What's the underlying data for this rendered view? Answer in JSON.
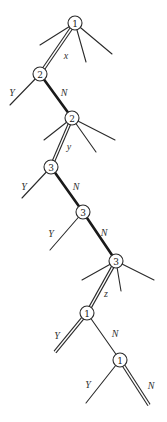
{
  "diagram": {
    "type": "search-tree",
    "nodes": [
      {
        "id": "n1",
        "label": "1",
        "x": 75,
        "y": 23
      },
      {
        "id": "n2",
        "label": "2",
        "x": 40,
        "y": 74
      },
      {
        "id": "n3",
        "label": "2",
        "x": 72,
        "y": 118
      },
      {
        "id": "n4",
        "label": "3",
        "x": 51,
        "y": 167
      },
      {
        "id": "n5",
        "label": "3",
        "x": 83,
        "y": 212
      },
      {
        "id": "n6",
        "label": "3",
        "x": 116,
        "y": 261
      },
      {
        "id": "n7",
        "label": "1",
        "x": 87,
        "y": 313
      },
      {
        "id": "n8",
        "label": "1",
        "x": 120,
        "y": 360
      }
    ],
    "edges": [
      {
        "from": [
          75,
          23
        ],
        "to": [
          40,
          45
        ],
        "style": "thin"
      },
      {
        "from": [
          75,
          23
        ],
        "to": [
          86,
          62
        ],
        "style": "thin"
      },
      {
        "from": [
          75,
          23
        ],
        "to": [
          112,
          54
        ],
        "style": "thin"
      },
      {
        "from": [
          75,
          23
        ],
        "to": [
          40,
          74
        ],
        "style": "double"
      },
      {
        "from": [
          40,
          74
        ],
        "to": [
          10,
          105
        ],
        "style": "thin"
      },
      {
        "from": [
          40,
          74
        ],
        "to": [
          72,
          118
        ],
        "style": "bold"
      },
      {
        "from": [
          72,
          118
        ],
        "to": [
          44,
          140
        ],
        "style": "thin"
      },
      {
        "from": [
          72,
          118
        ],
        "to": [
          96,
          152
        ],
        "style": "thin"
      },
      {
        "from": [
          72,
          118
        ],
        "to": [
          115,
          140
        ],
        "style": "thin"
      },
      {
        "from": [
          72,
          118
        ],
        "to": [
          51,
          167
        ],
        "style": "double"
      },
      {
        "from": [
          51,
          167
        ],
        "to": [
          22,
          198
        ],
        "style": "thin"
      },
      {
        "from": [
          51,
          167
        ],
        "to": [
          83,
          212
        ],
        "style": "bold"
      },
      {
        "from": [
          83,
          212
        ],
        "to": [
          50,
          250
        ],
        "style": "thin"
      },
      {
        "from": [
          83,
          212
        ],
        "to": [
          116,
          261
        ],
        "style": "bold"
      },
      {
        "from": [
          116,
          261
        ],
        "to": [
          82,
          280
        ],
        "style": "thin"
      },
      {
        "from": [
          116,
          261
        ],
        "to": [
          121,
          291
        ],
        "style": "thin"
      },
      {
        "from": [
          116,
          261
        ],
        "to": [
          154,
          280
        ],
        "style": "thin"
      },
      {
        "from": [
          116,
          261
        ],
        "to": [
          87,
          313
        ],
        "style": "double"
      },
      {
        "from": [
          87,
          313
        ],
        "to": [
          55,
          352
        ],
        "style": "double"
      },
      {
        "from": [
          87,
          313
        ],
        "to": [
          120,
          360
        ],
        "style": "thin"
      },
      {
        "from": [
          120,
          360
        ],
        "to": [
          86,
          403
        ],
        "style": "thin"
      },
      {
        "from": [
          120,
          360
        ],
        "to": [
          149,
          405
        ],
        "style": "double"
      }
    ],
    "edge_labels": [
      {
        "text": "x",
        "x": 66,
        "y": 55
      },
      {
        "text": "Y",
        "x": 12,
        "y": 92
      },
      {
        "text": "N",
        "x": 64,
        "y": 92
      },
      {
        "text": "y",
        "x": 69,
        "y": 146
      },
      {
        "text": "Y",
        "x": 24,
        "y": 186
      },
      {
        "text": "N",
        "x": 76,
        "y": 186
      },
      {
        "text": "Y",
        "x": 51,
        "y": 233
      },
      {
        "text": "N",
        "x": 104,
        "y": 232
      },
      {
        "text": "z",
        "x": 106,
        "y": 293
      },
      {
        "text": "Y",
        "x": 57,
        "y": 335
      },
      {
        "text": "N",
        "x": 115,
        "y": 333
      },
      {
        "text": "Y",
        "x": 88,
        "y": 384
      },
      {
        "text": "N",
        "x": 151,
        "y": 385
      }
    ],
    "node_radius": 7
  }
}
